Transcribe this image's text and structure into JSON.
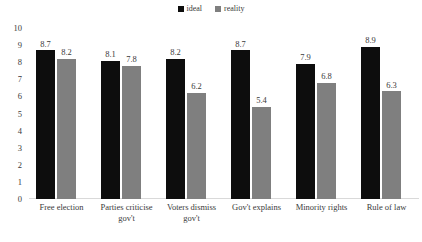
{
  "chart_data": {
    "type": "bar",
    "title": "",
    "xlabel": "",
    "ylabel": "",
    "ylim": [
      0,
      10
    ],
    "ytick_step": 1,
    "yticks": [
      "10",
      "9",
      "8",
      "7",
      "6",
      "5",
      "4",
      "3",
      "2",
      "1",
      "0"
    ],
    "grid": false,
    "legend_position": "top-center",
    "categories": [
      "Free election",
      "Parties criticise gov't",
      "Voters dismiss gov't",
      "Gov't explains",
      "Minority rights",
      "Rule of law"
    ],
    "series": [
      {
        "name": "ideal",
        "color": "#0d0d0d",
        "values": [
          8.7,
          8.1,
          8.2,
          8.7,
          7.9,
          8.9
        ],
        "labels": [
          "8.7",
          "8.1",
          "8.2",
          "8.7",
          "7.9",
          "8.9"
        ]
      },
      {
        "name": "reality",
        "color": "#7f7f7f",
        "values": [
          8.2,
          7.8,
          6.2,
          5.4,
          6.8,
          6.3
        ],
        "labels": [
          "8.2",
          "7.8",
          "6.2",
          "5.4",
          "6.8",
          "6.3"
        ]
      }
    ]
  },
  "legend": {
    "items": [
      {
        "label": "ideal",
        "swatch": "legend-swatch-ideal"
      },
      {
        "label": "reality",
        "swatch": "legend-swatch-reality"
      }
    ]
  },
  "colors": {
    "ideal": "#0d0d0d",
    "reality": "#7f7f7f",
    "axis_line": "#d9d9d9",
    "text": "#3a3a3a",
    "background": "#ffffff"
  }
}
